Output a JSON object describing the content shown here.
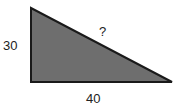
{
  "diagram": {
    "type": "right-triangle",
    "fill_color": "#6e6e6e",
    "stroke_color": "#1a1a1a",
    "labels": {
      "vertical_side": "30",
      "horizontal_side": "40",
      "hypotenuse": "?"
    }
  }
}
